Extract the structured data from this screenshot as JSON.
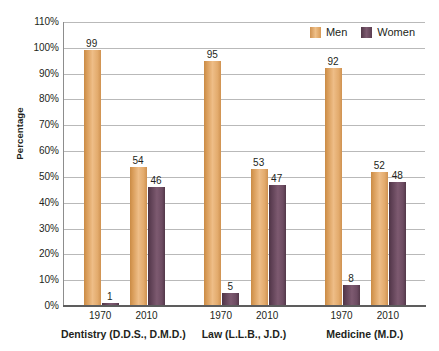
{
  "chart_data": {
    "type": "bar",
    "title": "",
    "xlabel": "",
    "ylabel": "Percentage",
    "ylim": [
      0,
      110
    ],
    "ytick_labels": [
      "110%",
      "100%",
      "90%",
      "80%",
      "70%",
      "60%",
      "50%",
      "40%",
      "30%",
      "20%",
      "10%",
      "0%"
    ],
    "ytick_values": [
      110,
      100,
      90,
      80,
      70,
      60,
      50,
      40,
      30,
      20,
      10,
      0
    ],
    "grid": true,
    "legend_position": "top-right",
    "legend": [
      "Men",
      "Women"
    ],
    "groups": [
      {
        "label": "Dentistry (D.D.S., D.M.D.)",
        "years": [
          {
            "year": "1970",
            "men": 99,
            "women": 1
          },
          {
            "year": "2010",
            "men": 54,
            "women": 46
          }
        ]
      },
      {
        "label": "Law (L.L.B., J.D.)",
        "years": [
          {
            "year": "1970",
            "men": 95,
            "women": 5
          },
          {
            "year": "2010",
            "men": 53,
            "women": 47
          }
        ]
      },
      {
        "label": "Medicine (M.D.)",
        "years": [
          {
            "year": "1970",
            "men": 92,
            "women": 8
          },
          {
            "year": "2010",
            "men": 52,
            "women": 48
          }
        ]
      }
    ],
    "categories": [
      "Dentistry 1970",
      "Dentistry 2010",
      "Law 1970",
      "Law 2010",
      "Medicine 1970",
      "Medicine 2010"
    ],
    "series": [
      {
        "name": "Men",
        "values": [
          99,
          54,
          95,
          53,
          92,
          52
        ],
        "color": "#e0a767"
      },
      {
        "name": "Women",
        "values": [
          1,
          46,
          5,
          47,
          8,
          48
        ],
        "color": "#6d4c62"
      }
    ]
  },
  "colors": {
    "men": "#e0a767",
    "women": "#6d4c62",
    "gridline": "#b9b9b9",
    "axis": "#5d5d5d",
    "text": "#231f20",
    "background": "#ffffff"
  }
}
